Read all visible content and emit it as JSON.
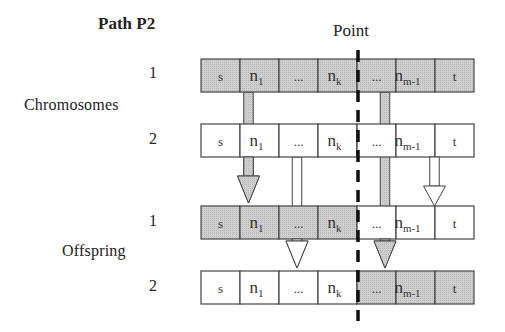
{
  "title": "Path P2",
  "point_label": "Point",
  "groups": [
    {
      "label": "Chromosomes"
    },
    {
      "label": "Offspring"
    }
  ],
  "colors": {
    "shaded": "#c9c9c9",
    "plain": "#ffffff",
    "stroke": "#444444",
    "cut_line": "#111111"
  },
  "cells": [
    {
      "main": "s",
      "sub": ""
    },
    {
      "main": "n",
      "sub": "1"
    },
    {
      "main": "...",
      "sub": ""
    },
    {
      "main": "n",
      "sub": "k"
    },
    {
      "main": "...",
      "sub": ""
    },
    {
      "main": "n",
      "sub": "m-1"
    },
    {
      "main": "t",
      "sub": ""
    }
  ],
  "rows": [
    {
      "id": "chromosome-1",
      "group": "Chromosomes",
      "number": "1",
      "shaded": [
        true,
        true,
        true,
        true,
        true,
        true,
        true
      ]
    },
    {
      "id": "chromosome-2",
      "group": "Chromosomes",
      "number": "2",
      "shaded": [
        false,
        false,
        false,
        false,
        false,
        false,
        false
      ]
    },
    {
      "id": "offspring-1",
      "group": "Offspring",
      "number": "1",
      "shaded": [
        true,
        true,
        true,
        true,
        false,
        false,
        false
      ]
    },
    {
      "id": "offspring-2",
      "group": "Offspring",
      "number": "2",
      "shaded": [
        false,
        false,
        false,
        false,
        true,
        true,
        true
      ]
    }
  ],
  "arrows": [
    {
      "name": "arrow-chrom1-n1-to-offspring1",
      "from_row": 0,
      "to_row": 2,
      "cell": 1,
      "shaded": true
    },
    {
      "name": "arrow-chrom1-dots-to-offspring2",
      "from_row": 0,
      "to_row": 3,
      "cell": 4,
      "shaded": true
    },
    {
      "name": "arrow-chrom2-dots-to-offspring2",
      "from_row": 1,
      "to_row": 3,
      "cell": 2,
      "shaded": false
    },
    {
      "name": "arrow-chrom2-nm1-to-offspring1",
      "from_row": 1,
      "to_row": 2,
      "cell": 5,
      "shaded": false
    }
  ]
}
